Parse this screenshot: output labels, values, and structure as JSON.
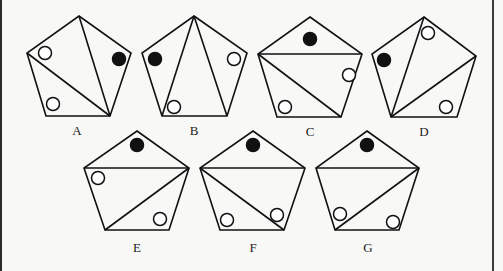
{
  "figure": {
    "stroke_color": "#111111",
    "fill_black": "#111111",
    "fill_white": "#ffffff",
    "circle_radius": 6.5,
    "panels": [
      {
        "label": "A",
        "label_pos": [
          77,
          130
        ],
        "vertices": [
          [
            79,
            16
          ],
          [
            131,
            53
          ],
          [
            110,
            116
          ],
          [
            46,
            116
          ],
          [
            27,
            53
          ]
        ],
        "diagonals": [
          [
            0,
            2
          ],
          [
            4,
            2
          ]
        ],
        "circles": [
          {
            "type": "open",
            "pos": [
              45,
              53
            ]
          },
          {
            "type": "filled",
            "pos": [
              119,
              59
            ]
          },
          {
            "type": "open",
            "pos": [
              53,
              104
            ]
          }
        ]
      },
      {
        "label": "B",
        "label_pos": [
          194,
          130
        ],
        "vertices": [
          [
            194,
            16
          ],
          [
            247,
            53
          ],
          [
            227,
            116
          ],
          [
            162,
            116
          ],
          [
            142,
            53
          ]
        ],
        "diagonals": [
          [
            0,
            3
          ],
          [
            0,
            2
          ]
        ],
        "circles": [
          {
            "type": "filled",
            "pos": [
              155,
              59
            ]
          },
          {
            "type": "open",
            "pos": [
              234,
              59
            ]
          },
          {
            "type": "open",
            "pos": [
              174,
              107
            ]
          }
        ]
      },
      {
        "label": "C",
        "label_pos": [
          310,
          131
        ],
        "vertices": [
          [
            310,
            17
          ],
          [
            362,
            54
          ],
          [
            341,
            117
          ],
          [
            277,
            117
          ],
          [
            258,
            54
          ]
        ],
        "diagonals": [
          [
            4,
            1
          ],
          [
            4,
            2
          ]
        ],
        "circles": [
          {
            "type": "filled",
            "pos": [
              310,
              39
            ]
          },
          {
            "type": "open",
            "pos": [
              349,
              75
            ]
          },
          {
            "type": "open",
            "pos": [
              285,
              107
            ]
          }
        ]
      },
      {
        "label": "D",
        "label_pos": [
          424,
          131
        ],
        "vertices": [
          [
            424,
            17
          ],
          [
            476,
            56
          ],
          [
            457,
            117
          ],
          [
            391,
            117
          ],
          [
            372,
            54
          ]
        ],
        "diagonals": [
          [
            3,
            0
          ],
          [
            3,
            1
          ]
        ],
        "circles": [
          {
            "type": "open",
            "pos": [
              428,
              33
            ]
          },
          {
            "type": "filled",
            "pos": [
              384,
              60
            ]
          },
          {
            "type": "open",
            "pos": [
              446,
              107
            ]
          }
        ]
      },
      {
        "label": "E",
        "label_pos": [
          137,
          247
        ],
        "vertices": [
          [
            137,
            131
          ],
          [
            189,
            168
          ],
          [
            169,
            230
          ],
          [
            105,
            230
          ],
          [
            84,
            168
          ]
        ],
        "diagonals": [
          [
            4,
            1
          ],
          [
            1,
            3
          ]
        ],
        "circles": [
          {
            "type": "filled",
            "pos": [
              137,
              145
            ]
          },
          {
            "type": "open",
            "pos": [
              98,
              178
            ]
          },
          {
            "type": "open",
            "pos": [
              160,
              219
            ]
          }
        ]
      },
      {
        "label": "F",
        "label_pos": [
          253,
          247
        ],
        "vertices": [
          [
            253,
            131
          ],
          [
            305,
            168
          ],
          [
            284,
            230
          ],
          [
            220,
            230
          ],
          [
            200,
            168
          ]
        ],
        "diagonals": [
          [
            4,
            1
          ],
          [
            4,
            2
          ]
        ],
        "circles": [
          {
            "type": "filled",
            "pos": [
              253,
              145
            ]
          },
          {
            "type": "open",
            "pos": [
              227,
              220
            ]
          },
          {
            "type": "open",
            "pos": [
              277,
              215
            ]
          }
        ]
      },
      {
        "label": "G",
        "label_pos": [
          368,
          247
        ],
        "vertices": [
          [
            367,
            131
          ],
          [
            419,
            168
          ],
          [
            399,
            230
          ],
          [
            335,
            230
          ],
          [
            316,
            168
          ]
        ],
        "diagonals": [
          [
            4,
            1
          ],
          [
            1,
            3
          ]
        ],
        "circles": [
          {
            "type": "filled",
            "pos": [
              367,
              145
            ]
          },
          {
            "type": "open",
            "pos": [
              340,
              214
            ]
          },
          {
            "type": "open",
            "pos": [
              393,
              222
            ]
          }
        ]
      }
    ]
  }
}
